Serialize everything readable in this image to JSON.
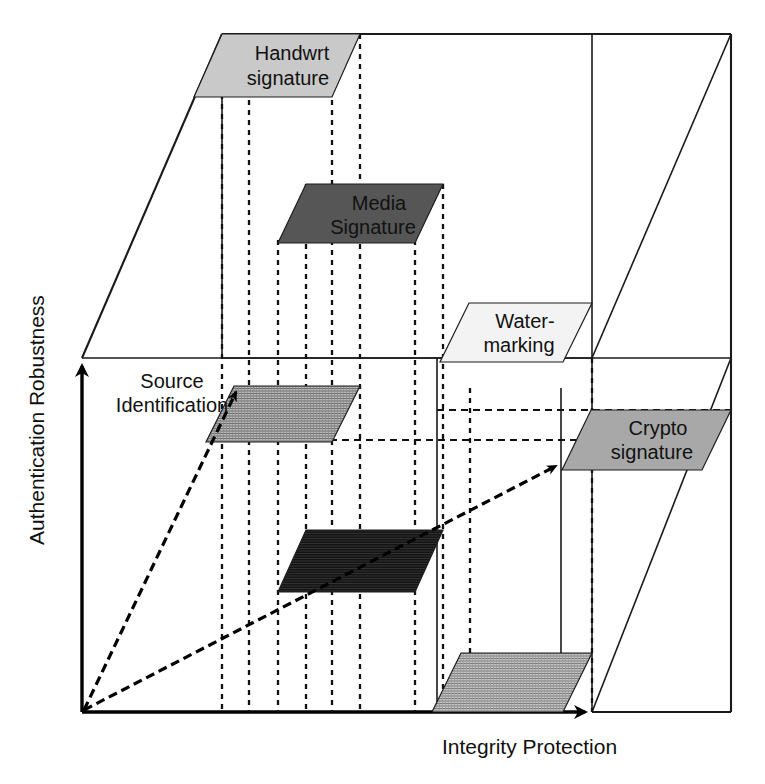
{
  "figure": {
    "type": "3d-conceptual-cube-diagram",
    "background_color": "#ffffff",
    "line_color": "#1a1a1a"
  },
  "axes": {
    "y_label": "Authentication Robustness",
    "x_label": "Integrity Protection",
    "depth_label": ""
  },
  "plates": [
    {
      "id": "handwrt-signature",
      "label_line1": "Handwrt",
      "label_line2": "signature",
      "fill": "#c9c9c9",
      "texture": "solid"
    },
    {
      "id": "media-signature",
      "label_line1": "Media",
      "label_line2": "Signature",
      "fill": "#565656",
      "texture": "solid"
    },
    {
      "id": "water-marking",
      "label_line1": "Water-",
      "label_line2": "marking",
      "fill": "#f2f2f2",
      "texture": "solid"
    },
    {
      "id": "crypto-signature",
      "label_line1": "Crypto",
      "label_line2": "signature",
      "fill": "#a8a8a8",
      "texture": "solid"
    },
    {
      "id": "source-identification-plate",
      "label_line1": "",
      "label_line2": "",
      "fill": "#9a9a9a",
      "texture": "hatched"
    },
    {
      "id": "media-signature-floor-plate",
      "label_line1": "",
      "label_line2": "",
      "fill": "#1a1a1a",
      "texture": "hatched"
    },
    {
      "id": "crypto-floor-plate",
      "label_line1": "",
      "label_line2": "",
      "fill": "#8f8f8f",
      "texture": "hatched"
    }
  ],
  "callouts": [
    {
      "id": "source-identification",
      "line1": "Source",
      "line2": "Identification"
    }
  ]
}
